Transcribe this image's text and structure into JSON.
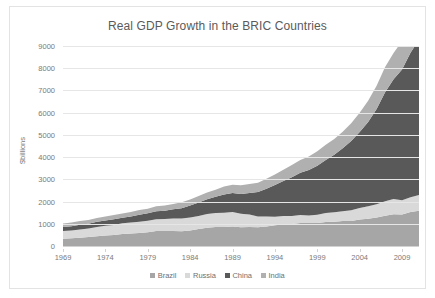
{
  "chart_data": {
    "type": "area",
    "stacked": true,
    "title": "Real GDP Growth in the BRIC Countries",
    "xlabel": "",
    "ylabel": "$billions",
    "ylim": [
      0,
      9000
    ],
    "xlim": [
      1969,
      2011
    ],
    "grid": true,
    "legend_position": "bottom",
    "y_ticks": [
      0,
      1000,
      2000,
      3000,
      4000,
      5000,
      6000,
      7000,
      8000,
      9000
    ],
    "x_ticks": [
      1969,
      1974,
      1979,
      1984,
      1989,
      1994,
      1999,
      2004,
      2009
    ],
    "x": [
      1969,
      1970,
      1971,
      1972,
      1973,
      1974,
      1975,
      1976,
      1977,
      1978,
      1979,
      1980,
      1981,
      1982,
      1983,
      1984,
      1985,
      1986,
      1987,
      1988,
      1989,
      1990,
      1991,
      1992,
      1993,
      1994,
      1995,
      1996,
      1997,
      1998,
      1999,
      2000,
      2001,
      2002,
      2003,
      2004,
      2005,
      2006,
      2007,
      2008,
      2009,
      2010,
      2011
    ],
    "series": [
      {
        "name": "Brazil",
        "color": "#a6a6a6",
        "values": [
          330,
          345,
          370,
          400,
          435,
          470,
          490,
          540,
          560,
          580,
          620,
          680,
          670,
          680,
          660,
          700,
          760,
          820,
          850,
          850,
          880,
          840,
          850,
          840,
          880,
          930,
          970,
          990,
          1030,
          1030,
          1040,
          1080,
          1090,
          1120,
          1130,
          1190,
          1230,
          1280,
          1360,
          1430,
          1420,
          1530,
          1590
        ]
      },
      {
        "name": "Russia",
        "color": "#d9d9d9",
        "values": [
          340,
          355,
          375,
          390,
          420,
          440,
          455,
          480,
          495,
          515,
          520,
          525,
          540,
          555,
          575,
          585,
          590,
          620,
          630,
          650,
          650,
          610,
          570,
          490,
          445,
          390,
          375,
          360,
          365,
          345,
          370,
          405,
          425,
          445,
          480,
          520,
          555,
          600,
          655,
          690,
          635,
          665,
          700
        ]
      },
      {
        "name": "China",
        "color": "#595959",
        "values": [
          180,
          190,
          210,
          215,
          235,
          240,
          260,
          255,
          275,
          310,
          335,
          360,
          380,
          415,
          465,
          535,
          605,
          660,
          735,
          820,
          855,
          885,
          965,
          1100,
          1255,
          1420,
          1580,
          1740,
          1900,
          2050,
          2200,
          2390,
          2590,
          2830,
          3110,
          3420,
          3800,
          4290,
          4900,
          5380,
          5890,
          6500,
          7000
        ]
      },
      {
        "name": "India",
        "color": "#b0b0b0",
        "values": [
          160,
          165,
          165,
          160,
          170,
          175,
          190,
          190,
          205,
          220,
          205,
          220,
          235,
          245,
          265,
          275,
          290,
          305,
          320,
          355,
          375,
          395,
          400,
          420,
          445,
          475,
          510,
          550,
          570,
          605,
          655,
          680,
          715,
          745,
          805,
          870,
          950,
          1040,
          1140,
          1180,
          1280,
          1390,
          1470
        ]
      }
    ]
  },
  "legend": {
    "items": [
      {
        "label": "Brazil",
        "color": "#a6a6a6"
      },
      {
        "label": "Russia",
        "color": "#d9d9d9"
      },
      {
        "label": "China",
        "color": "#595959"
      },
      {
        "label": "India",
        "color": "#b0b0b0"
      }
    ]
  }
}
